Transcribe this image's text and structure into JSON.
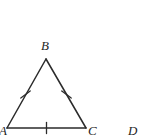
{
  "figure": {
    "kind": "geometry-diagram",
    "background_color": "#ffffff",
    "stroke_color": "#2b2b2b",
    "label_color": "#1f1f1f",
    "stroke_width": 1.5,
    "canvas": {
      "width": 147,
      "height": 139
    },
    "shape": {
      "name": "triangle",
      "type": "equilateral",
      "vertices": [
        {
          "id": "A",
          "x": 7,
          "y": 128
        },
        {
          "id": "B",
          "x": 46,
          "y": 59
        },
        {
          "id": "C",
          "x": 86,
          "y": 128
        }
      ],
      "sides": [
        {
          "id": "AB",
          "from": "A",
          "to": "B",
          "tick_count": 1,
          "tick_style": "slash"
        },
        {
          "id": "BC",
          "from": "B",
          "to": "C",
          "tick_count": 1,
          "tick_style": "slash"
        },
        {
          "id": "AC",
          "from": "A",
          "to": "C",
          "tick_count": 1,
          "tick_style": "vertical"
        }
      ]
    },
    "tick_marks": [
      {
        "id": "tick-AB",
        "side": "AB",
        "x": 25.5,
        "y": 94.5,
        "angle_deg": 30
      },
      {
        "id": "tick-BC",
        "side": "BC",
        "x": 66.5,
        "y": 94.5,
        "angle_deg": -30
      },
      {
        "id": "tick-AC",
        "side": "AC",
        "x": 46.5,
        "y": 128,
        "angle_deg": 0
      }
    ],
    "labels": [
      {
        "id": "B",
        "text": "B",
        "x": 47,
        "y": 46,
        "anchor_vertex": "B",
        "position": "above"
      },
      {
        "id": "A",
        "text": "A",
        "x": 4,
        "y": 131,
        "anchor_vertex": "A",
        "position": "below-left"
      },
      {
        "id": "C",
        "text": "C",
        "x": 92,
        "y": 131,
        "anchor_vertex": "C",
        "position": "below-right"
      },
      {
        "id": "D",
        "text": "D",
        "x": 134,
        "y": 131,
        "anchor_vertex": null,
        "position": "standalone-right"
      }
    ]
  }
}
